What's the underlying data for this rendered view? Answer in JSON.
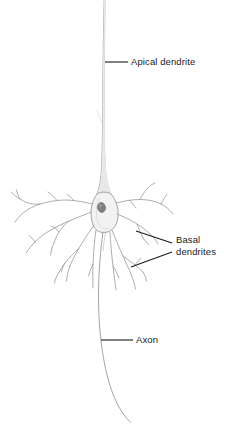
{
  "figure": {
    "background_color": "#ffffff",
    "width": 237,
    "height": 433
  },
  "colors": {
    "leader_line": "#1a1a1a",
    "label_text": "#1a1a1a",
    "soma_outline": "#8d8d8d",
    "soma_fill": "#f3f3f3",
    "nucleus_fill": "#7a7a7a",
    "dendrite_stroke": "#9a9a9a",
    "apical_stroke": "#a0a0a0",
    "axon_stroke": "#a5a5a5"
  },
  "labels": [
    {
      "id": "apical-dendrite",
      "text": "Apical dendrite",
      "lines": [
        "Apical dendrite"
      ],
      "leader": {
        "x1": 105,
        "y1": 62,
        "x2": 128,
        "y2": 62,
        "style": "horizontal"
      }
    },
    {
      "id": "basal-dendrites",
      "text": "Basal dendrites",
      "lines": [
        "Basal",
        "dendrites"
      ],
      "line1": "Basal",
      "line2": "dendrites",
      "leaders": [
        {
          "x1": 136,
          "y1": 231,
          "x2": 172,
          "y2": 243,
          "style": "diagonal"
        },
        {
          "x1": 131,
          "y1": 267,
          "x2": 172,
          "y2": 252,
          "style": "diagonal"
        }
      ]
    },
    {
      "id": "axon",
      "text": "Axon",
      "lines": [
        "Axon"
      ],
      "leader": {
        "x1": 101,
        "y1": 340,
        "x2": 133,
        "y2": 340,
        "style": "horizontal"
      }
    }
  ],
  "anatomy": {
    "parts": [
      {
        "name": "apical-dendrite",
        "description": "Long thin process extending from soma apex to top of frame"
      },
      {
        "name": "soma",
        "description": "Pyramidal cell body"
      },
      {
        "name": "nucleus",
        "description": "Dark oval nucleus inside soma"
      },
      {
        "name": "basal-dendrites",
        "description": "Branching processes radiating laterally and downward from soma base"
      },
      {
        "name": "axon",
        "description": "Single long process descending from soma base, curving to lower right"
      }
    ]
  }
}
